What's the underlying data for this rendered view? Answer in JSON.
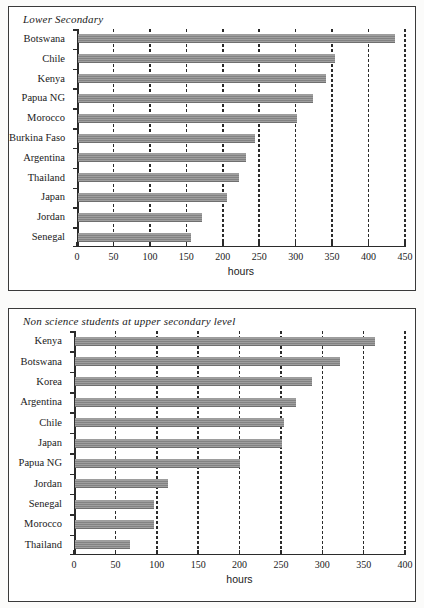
{
  "page": {
    "background": "#fbfbfa",
    "bar_color": "#8a8a8a",
    "axis_color": "#2b2b2b"
  },
  "charts": [
    {
      "id": "lower-secondary",
      "title": "Lower Secondary",
      "xlabel": "hours"
    },
    {
      "id": "non-science-upper-secondary",
      "title": "Non science students at upper secondary level",
      "xlabel": "hours"
    }
  ],
  "chart_data": [
    {
      "type": "bar",
      "orientation": "horizontal",
      "title": "Lower Secondary",
      "xlabel": "hours",
      "ylabel": "",
      "xlim": [
        0,
        450
      ],
      "xticks": [
        0,
        50,
        100,
        150,
        200,
        250,
        300,
        350,
        400,
        450
      ],
      "xticklabels": [
        "0",
        "50",
        "100",
        "150",
        "200",
        "250",
        "300",
        "350",
        "400",
        "450"
      ],
      "grid": true,
      "legend": false,
      "categories": [
        "Botswana",
        "Chile",
        "Kenya",
        "Papua NG",
        "Morocco",
        "Burkina Faso",
        "Argentina",
        "Thailand",
        "Japan",
        "Jordan",
        "Senegal"
      ],
      "values": [
        435,
        353,
        340,
        323,
        301,
        243,
        230,
        221,
        205,
        170,
        155
      ]
    },
    {
      "type": "bar",
      "orientation": "horizontal",
      "title": "Non science students at upper secondary level",
      "xlabel": "hours",
      "ylabel": "",
      "xlim": [
        0,
        400
      ],
      "xticks": [
        0,
        50,
        100,
        150,
        200,
        250,
        300,
        350,
        400
      ],
      "xticklabels": [
        "0",
        "50",
        "100",
        "150",
        "200",
        "250",
        "300",
        "350",
        "400"
      ],
      "grid": true,
      "legend": false,
      "categories": [
        "Kenya",
        "Botswana",
        "Korea",
        "Argentina",
        "Chile",
        "Japan",
        "Papua NG",
        "Jordan",
        "Senegal",
        "Morocco",
        "Thailand"
      ],
      "values": [
        363,
        320,
        287,
        267,
        252,
        250,
        199,
        112,
        96,
        95,
        67
      ]
    }
  ]
}
